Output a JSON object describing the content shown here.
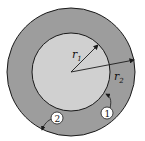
{
  "diagram": {
    "type": "concentric-circles",
    "colors": {
      "outer_fill": "#9d9d9d",
      "inner_fill": "#d0d0d0",
      "stroke": "#1a1a1a",
      "background": "#ffffff"
    },
    "labels": {
      "r1": {
        "main": "r",
        "sub": "1"
      },
      "r2": {
        "main": "r",
        "sub": "2"
      },
      "surface1": "1",
      "surface2": "2"
    }
  }
}
